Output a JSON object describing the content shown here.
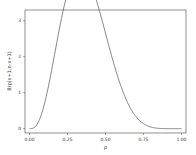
{
  "chart_data": {
    "type": "line",
    "title": "",
    "xlabel": "p",
    "ylabel": "B(p|x+1,n-x+1)",
    "xlim": [
      -0.03,
      1.03
    ],
    "ylim": [
      -0.12,
      3.3
    ],
    "xticks": [
      "0.00",
      "0.25",
      "0.50",
      "0.75",
      "1.00"
    ],
    "yticks": [
      "0",
      "1",
      "2",
      "3"
    ],
    "grid": false,
    "legend": null,
    "series": [
      {
        "name": "Beta density",
        "color": "#555555",
        "x": [
          0.0,
          0.05,
          0.1,
          0.15,
          0.2,
          0.25,
          0.3,
          0.333,
          0.35,
          0.4,
          0.45,
          0.5,
          0.55,
          0.6,
          0.65,
          0.7,
          0.75,
          0.8,
          0.85,
          0.9,
          0.95,
          1.0
        ],
        "y": [
          0.0,
          0.09,
          0.52,
          1.18,
          1.94,
          2.52,
          2.95,
          3.08,
          3.06,
          2.87,
          2.44,
          1.89,
          1.33,
          0.84,
          0.47,
          0.23,
          0.09,
          0.03,
          0.01,
          0.0,
          0.0,
          0.0
        ]
      }
    ]
  }
}
